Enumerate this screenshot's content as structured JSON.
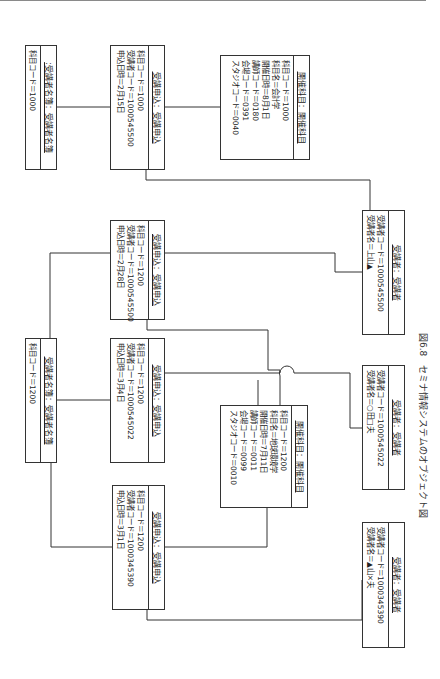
{
  "figure": {
    "caption_number": "図6.8",
    "caption_title": "セミナ情報システムのオブジェクト図"
  },
  "objects": {
    "roster_1000": {
      "header": ":受講者名簿：受講者名簿",
      "attrs": [
        "科目コード＝1000"
      ]
    },
    "app_1000_0215": {
      "header": "受講申込：受講申込",
      "attrs": [
        "科目コード＝1000",
        "受講者コード＝1000545500",
        "申込日時＝2月15日"
      ]
    },
    "course_1000": {
      "header": "開催科目：開催科目",
      "attrs": [
        "科目コード＝1000",
        "科目名＝会計学",
        "開催日時＝8月1日",
        "講師コード＝0180",
        "会場コード＝0391",
        "スタジオコード＝0040"
      ]
    },
    "student_1000545500": {
      "header": "受講者：受講者",
      "attrs": [
        "受講者コード＝1000545500",
        "受講者名＝上山▲"
      ]
    },
    "app_1200_0228": {
      "header": "受講申込：受講申込",
      "attrs": [
        "科目コード＝1200",
        "受講者コード＝1000545500",
        "申込日時＝2月28日"
      ]
    },
    "roster_1200": {
      "header": "受講者名簿：受講者名簿",
      "attrs": [
        "科目コード＝1200"
      ]
    },
    "app_1200_0304": {
      "header": "受講申込：受講申込",
      "attrs": [
        "科目コード＝1200",
        "受講者コード＝1000545022",
        "申込日時＝3月4日"
      ]
    },
    "course_1200": {
      "header": "開催科目：開催科目",
      "attrs": [
        "科目コード＝1200",
        "科目名＝地球環境学",
        "開催日時＝7月11日",
        "講師コード＝0011",
        "会場コード＝0099",
        "スタジオコード＝0010"
      ]
    },
    "student_1000545022": {
      "header": "受講者：受講者",
      "attrs": [
        "受講者コード＝1000545022",
        "受講者名＝○田□夫"
      ]
    },
    "app_1200_0301": {
      "header": "受講申込：受講申込",
      "attrs": [
        "科目コード＝1200",
        "受講者コード＝1000345390",
        "申込日時＝3月1日"
      ]
    },
    "student_1000345390": {
      "header": "受講者：受講者",
      "attrs": [
        "受講者コード＝1000345390",
        "受講者名＝▲山×夫"
      ]
    }
  },
  "colors": {
    "line": "#333333",
    "background": "#ffffff",
    "text": "#222222"
  }
}
